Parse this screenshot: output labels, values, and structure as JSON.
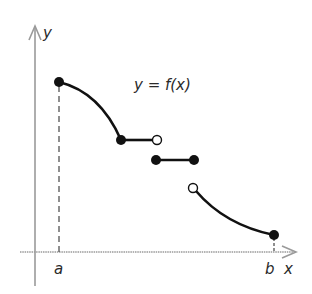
{
  "figure": {
    "function_label": "y = f(x)",
    "y_axis_label": "y",
    "x_axis_label": "x",
    "left_endpoint_label": "a",
    "right_endpoint_label": "b"
  },
  "colors": {
    "axis": "#9a9a9a",
    "curve": "#111111",
    "text": "#2a2a2a"
  },
  "pieces": [
    {
      "name": "decreasing-curve-1",
      "start": {
        "x": 59,
        "y": 82,
        "closed": true
      },
      "end": {
        "x": 121,
        "y": 140,
        "closed": true
      }
    },
    {
      "name": "flat-segment-1",
      "start": {
        "x": 121,
        "y": 140,
        "closed": true
      },
      "end": {
        "x": 157,
        "y": 140,
        "closed": false
      }
    },
    {
      "name": "flat-segment-2",
      "start": {
        "x": 156,
        "y": 160,
        "closed": true
      },
      "end": {
        "x": 194,
        "y": 160,
        "closed": true
      }
    },
    {
      "name": "decreasing-curve-2",
      "start": {
        "x": 193,
        "y": 188,
        "closed": false
      },
      "end": {
        "x": 274,
        "y": 235,
        "closed": true
      }
    }
  ]
}
